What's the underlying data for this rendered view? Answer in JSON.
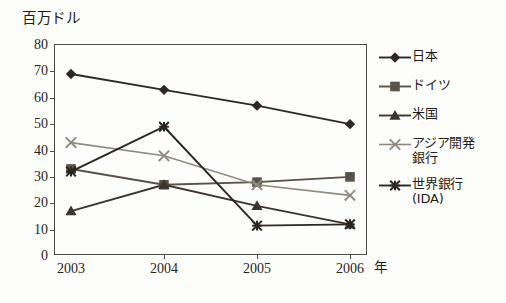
{
  "chart_data": {
    "type": "line",
    "title": "",
    "ylabel": "百万ドル",
    "xlabel": "年",
    "categories": [
      "2003",
      "2004",
      "2005",
      "2006"
    ],
    "x": [
      2003,
      2004,
      2005,
      2006
    ],
    "ylim": [
      0,
      80
    ],
    "yticks": [
      0,
      10,
      20,
      30,
      40,
      50,
      60,
      70,
      80
    ],
    "grid": false,
    "legend_position": "right",
    "series": [
      {
        "name": "日本",
        "label_lines": "日本",
        "marker": "diamond",
        "color": "#2e2823",
        "values": [
          69,
          63,
          57,
          50
        ]
      },
      {
        "name": "ドイツ",
        "label_lines": "ドイツ",
        "marker": "square",
        "color": "#585248",
        "values": [
          33,
          27,
          28,
          30
        ]
      },
      {
        "name": "米国",
        "label_lines": "米国",
        "marker": "triangle",
        "color": "#3c352e",
        "values": [
          17,
          27,
          19,
          12
        ]
      },
      {
        "name": "アジア開発銀行",
        "label_lines": "アジア開発\n銀行",
        "marker": "x",
        "color": "#8e8a80",
        "values": [
          43,
          38,
          27,
          23
        ]
      },
      {
        "name": "世界銀行(IDA)",
        "label_lines": "世界銀行\n(IDA)",
        "marker": "asterisk",
        "color": "#2b2620",
        "values": [
          32,
          49,
          11.5,
          12
        ]
      }
    ]
  }
}
